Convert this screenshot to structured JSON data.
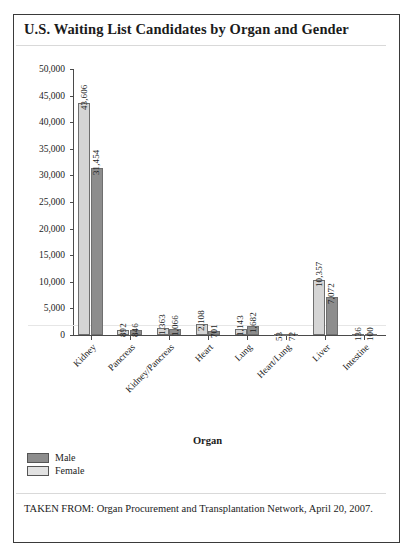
{
  "figure": {
    "title": "U.S. Waiting List Candidates by Organ and Gender",
    "source_note": "TAKEN FROM: Organ Procurement and Transplantation Network, April 20, 2007."
  },
  "legend": {
    "position": "bottom-left",
    "entries": [
      {
        "label": "Male",
        "color": "#8d8d8d"
      },
      {
        "label": "Female",
        "color": "#e2e2e2"
      }
    ]
  },
  "axes": {
    "x_title": "Organ",
    "y_ticks": [
      "0",
      "5,000",
      "10,000",
      "15,000",
      "20,000",
      "25,000",
      "30,000",
      "35,000",
      "40,000",
      "45,000",
      "50,000"
    ]
  },
  "chart_data": {
    "type": "bar",
    "title": "U.S. Waiting List Candidates by Organ and Gender",
    "xlabel": "Organ",
    "ylabel": "",
    "ylim": [
      0,
      50000
    ],
    "ytick_step": 5000,
    "grid": false,
    "legend_position": "bottom-left",
    "categories": [
      "Kidney",
      "Pancreas",
      "Kidney/Pancreas",
      "Heart",
      "Lung",
      "Heart/Lung",
      "Liver",
      "Intestine"
    ],
    "series": [
      {
        "name": "Male",
        "color": "#d5d5d5",
        "values": [
          43606,
          892,
          1363,
          2108,
          1143,
          53,
          10357,
          136
        ]
      },
      {
        "name": "Female",
        "color": "#8d8d8d",
        "values": [
          31454,
          846,
          1066,
          701,
          1682,
          72,
          7072,
          100
        ]
      }
    ],
    "data_labels": [
      [
        "43,606",
        "31,454"
      ],
      [
        "892",
        "846"
      ],
      [
        "1,363",
        "1,066"
      ],
      [
        "2,108",
        "701"
      ],
      [
        "1,143",
        "1,682"
      ],
      [
        "53",
        "72"
      ],
      [
        "10,357",
        "7,072"
      ],
      [
        "136",
        "100"
      ]
    ]
  }
}
